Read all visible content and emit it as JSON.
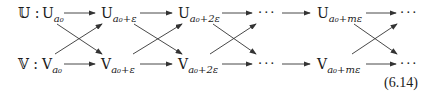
{
  "diagram": {
    "rows": [
      {
        "label": "𝕌 :",
        "nodes": [
          {
            "base": "U",
            "sub": "a₀"
          },
          {
            "base": "U",
            "sub": "a₀+ε"
          },
          {
            "base": "U",
            "sub": "a₀+2ε"
          },
          {
            "base": "···",
            "sub": ""
          },
          {
            "base": "U",
            "sub": "a₀+mε"
          },
          {
            "base": "···",
            "sub": ""
          }
        ]
      },
      {
        "label": "𝕍 :",
        "nodes": [
          {
            "base": "V",
            "sub": "a₀"
          },
          {
            "base": "V",
            "sub": "a₀+ε"
          },
          {
            "base": "V",
            "sub": "a₀+2ε"
          },
          {
            "base": "···",
            "sub": ""
          },
          {
            "base": "V",
            "sub": "a₀+mε"
          },
          {
            "base": "···",
            "sub": ""
          }
        ]
      }
    ],
    "edges": "horizontal arrows between consecutive nodes in each row; crossing diagonal arrows between rows",
    "equation_number": "(6.14)"
  }
}
